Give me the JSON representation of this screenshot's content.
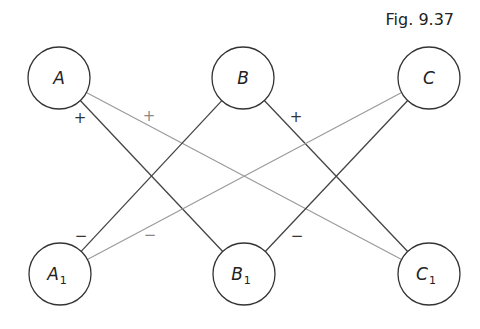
{
  "caption": "Fig. 9.37",
  "nodes": [
    {
      "id": "A",
      "label": "A",
      "sub": "",
      "x": 59,
      "y": 78
    },
    {
      "id": "B",
      "label": "B",
      "sub": "",
      "x": 243,
      "y": 78
    },
    {
      "id": "C",
      "label": "C",
      "sub": "",
      "x": 429,
      "y": 78
    },
    {
      "id": "A1",
      "label": "A",
      "sub": "1",
      "x": 60,
      "y": 274
    },
    {
      "id": "B1",
      "label": "B",
      "sub": "1",
      "x": 244,
      "y": 274
    },
    {
      "id": "C1",
      "label": "C",
      "sub": "1",
      "x": 429,
      "y": 274
    }
  ],
  "node_radius": 31,
  "edges": [
    {
      "from": "A",
      "to": "B1",
      "style": "dark"
    },
    {
      "from": "A",
      "to": "C1",
      "style": "light"
    },
    {
      "from": "B",
      "to": "A1",
      "style": "dark"
    },
    {
      "from": "B",
      "to": "C1",
      "style": "dark"
    },
    {
      "from": "C",
      "to": "A1",
      "style": "light"
    },
    {
      "from": "C",
      "to": "B1",
      "style": "dark"
    }
  ],
  "signs": [
    {
      "text": "+",
      "x": 80,
      "y": 123,
      "style": "dark"
    },
    {
      "text": "+",
      "x": 149,
      "y": 121,
      "style": "light"
    },
    {
      "text": "+",
      "x": 296,
      "y": 122,
      "style": "dark"
    },
    {
      "text": "−",
      "x": 81,
      "y": 241,
      "style": "dark"
    },
    {
      "text": "−",
      "x": 150,
      "y": 240,
      "style": "light"
    },
    {
      "text": "−",
      "x": 297,
      "y": 241,
      "style": "dark"
    }
  ],
  "colors": {
    "dark": "#444444",
    "light": "#999999",
    "circle": "#333333"
  }
}
